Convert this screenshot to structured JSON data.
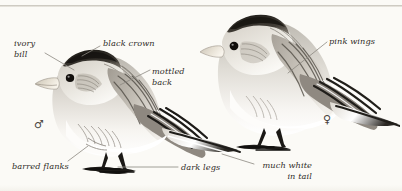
{
  "plate": {
    "background_color": "#fbfaf6",
    "ink_color": "#2e2b26",
    "leader_color": "#8c8880",
    "width": 402,
    "height": 191
  },
  "labels": [
    {
      "id": "ivory-bill",
      "text": "ivory\nbill",
      "align": "left",
      "x": 14,
      "y": 38
    },
    {
      "id": "black-crown",
      "text": "black crown",
      "align": "left",
      "x": 103,
      "y": 38
    },
    {
      "id": "mottled-back",
      "text": "mottled\nback",
      "align": "left",
      "x": 152,
      "y": 66
    },
    {
      "id": "pink-wings",
      "text": "pink wings",
      "align": "left",
      "x": 329,
      "y": 36
    },
    {
      "id": "barred-flanks",
      "text": "barred flanks",
      "align": "left",
      "x": 12,
      "y": 162
    },
    {
      "id": "dark-legs",
      "text": "dark legs",
      "align": "left",
      "x": 181,
      "y": 165
    },
    {
      "id": "much-white",
      "text": "much white\nin tail",
      "align": "right",
      "x": 256,
      "y": 162
    }
  ],
  "leaders": [
    {
      "id": "leader-ivory-bill",
      "x1": 45,
      "y1": 53,
      "x2": 72,
      "y2": 70
    },
    {
      "id": "leader-black-crown",
      "x1": 101,
      "y1": 47,
      "x2": 83,
      "y2": 56
    },
    {
      "id": "leader-mottled-back",
      "x1": 151,
      "y1": 70,
      "x2": 122,
      "y2": 84
    },
    {
      "id": "leader-pink-wings",
      "x1": 327,
      "y1": 42,
      "x2": 288,
      "y2": 72
    },
    {
      "id": "leader-barred-flanks",
      "x1": 68,
      "y1": 162,
      "x2": 87,
      "y2": 147
    },
    {
      "id": "leader-dark-legs",
      "x1": 178,
      "y1": 168,
      "x2": 118,
      "y2": 168
    },
    {
      "id": "leader-much-white",
      "x1": 254,
      "y1": 165,
      "x2": 222,
      "y2": 155
    }
  ],
  "specimens": [
    {
      "id": "male-bunting",
      "sex_symbol": "♂",
      "sex_x": 34,
      "sex_y": 118
    },
    {
      "id": "female-bunting",
      "sex_symbol": "♀",
      "sex_x": 323,
      "sex_y": 113
    }
  ]
}
